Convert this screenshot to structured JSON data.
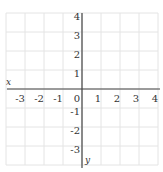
{
  "chart_data": {
    "type": "scatter",
    "title": "",
    "xlabel": "x",
    "ylabel": "y",
    "xlim": [
      -4,
      4
    ],
    "ylim": [
      -4,
      4
    ],
    "x_ticks": [
      -3,
      -2,
      -1,
      0,
      1,
      2,
      3,
      4
    ],
    "x_tick_labels": [
      "-3",
      "-2",
      "-1",
      "0",
      "1",
      "2",
      "3",
      "4"
    ],
    "y_ticks": [
      4,
      3,
      2,
      1,
      -1,
      -2,
      -3
    ],
    "y_tick_labels": [
      "4",
      "3",
      "2",
      "1",
      "-1",
      "-2",
      "-3"
    ],
    "grid": true,
    "series": [],
    "colors": {
      "grid": "#e4e4e4",
      "axis": "#444444",
      "text": "#333333"
    }
  }
}
